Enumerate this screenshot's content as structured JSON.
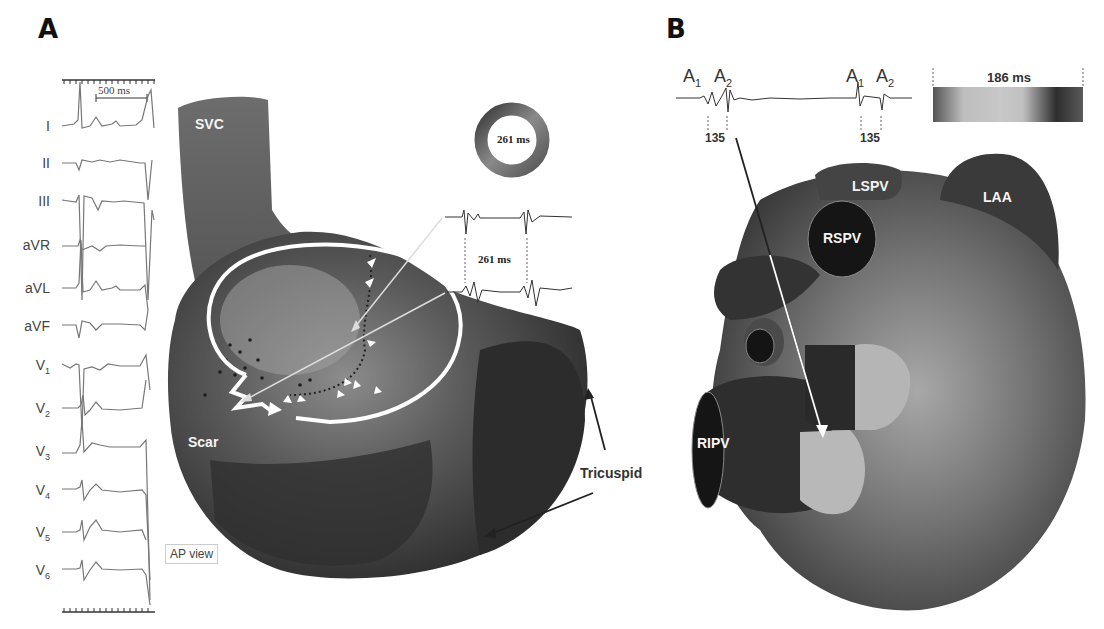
{
  "panels": {
    "A": {
      "letter": "A",
      "ecg": {
        "scale_label": "500 ms",
        "leads": [
          "I",
          "II",
          "III",
          "aVR",
          "aVL",
          "aVF",
          "V1",
          "V2",
          "V3",
          "V4",
          "V5",
          "V6"
        ]
      },
      "map": {
        "labels": {
          "svc": "SVC",
          "scar": "Scar",
          "tricuspid": "Tricuspid"
        },
        "cycle_ring_label": "261 ms",
        "electrogram_interval_label": "261 ms",
        "view_label": "AP view"
      }
    },
    "B": {
      "letter": "B",
      "electrogram": {
        "markers": [
          {
            "base": "A",
            "sub": "1"
          },
          {
            "base": "A",
            "sub": "2"
          },
          {
            "base": "A",
            "sub": "1"
          },
          {
            "base": "A",
            "sub": "2"
          }
        ],
        "intervals": [
          "135",
          "135"
        ]
      },
      "color_bar_label": "186 ms",
      "map": {
        "labels": {
          "lspv": "LSPV",
          "laa": "LAA",
          "rspv": "RSPV",
          "ripv": "RIPV"
        }
      }
    }
  },
  "colors": {
    "background": "#ffffff",
    "trace": "#777777",
    "map_dark": "#2e2e2e",
    "map_mid": "#5a5a5a",
    "map_light": "#9a9a9a",
    "annotation": "#ffffff"
  }
}
